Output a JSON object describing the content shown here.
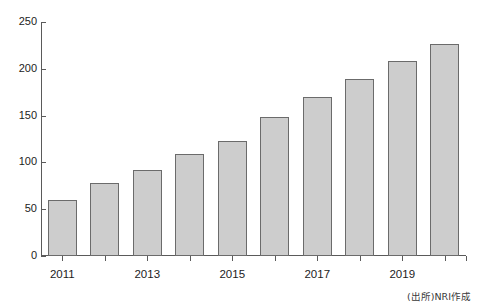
{
  "top_fragment": "",
  "source_note": "(出所)NRI作成",
  "chart_data": {
    "type": "bar",
    "title": "",
    "xlabel": "",
    "ylabel": "",
    "categories": [
      "2011",
      "2012",
      "2013",
      "2014",
      "2015",
      "2016",
      "2017",
      "2018",
      "2019",
      "2020"
    ],
    "values": [
      60,
      78,
      92,
      109,
      123,
      148,
      170,
      189,
      208,
      227
    ],
    "visible_tick_labels": [
      "2011",
      "2013",
      "2015",
      "2017",
      "2019"
    ],
    "ylim": [
      0,
      250
    ],
    "ytick_labels": [
      "0",
      "50",
      "100",
      "150",
      "200",
      "250"
    ],
    "ytick_values": [
      0,
      50,
      100,
      150,
      200,
      250
    ],
    "grid": false,
    "legend": null,
    "bar_fill_color": "#cdcdcd",
    "bar_border_color": "#6b6b6b",
    "axis_color": "#5a5a5a"
  }
}
